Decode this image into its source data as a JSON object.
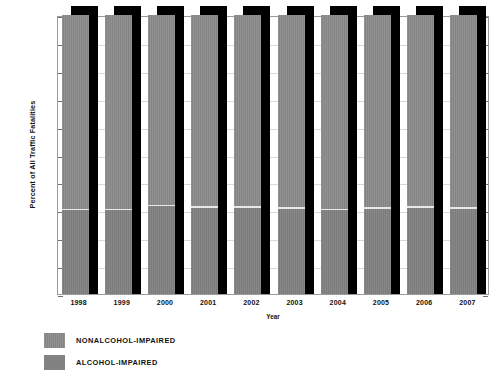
{
  "chart_data": {
    "type": "bar",
    "stacked": true,
    "title": "",
    "xlabel": "Year",
    "ylabel": "Percent of All Traffic Fatalities",
    "categories": [
      "1998",
      "1999",
      "2000",
      "2001",
      "2002",
      "2003",
      "2004",
      "2005",
      "2006",
      "2007"
    ],
    "ylim": [
      0,
      100
    ],
    "ytick_labels": [
      "0%",
      "10%",
      "20%",
      "30%",
      "40%",
      "50%",
      "60%",
      "70%",
      "80%",
      "90%",
      "100%"
    ],
    "ytick_values": [
      0,
      10,
      20,
      30,
      40,
      50,
      60,
      70,
      80,
      90,
      100
    ],
    "grid": true,
    "legend_position": "bottom-left",
    "series": [
      {
        "name": "NONALCOHOL-IMPAIRED",
        "color": "#8a8a8a",
        "values": [
          70.0,
          70.0,
          68.5,
          69.0,
          69.0,
          69.5,
          70.0,
          69.5,
          69.0,
          69.5
        ]
      },
      {
        "name": "ALCOHOL-IMPAIRED",
        "color": "#828282",
        "values": [
          30.0,
          30.0,
          31.5,
          31.0,
          31.0,
          30.5,
          30.0,
          30.5,
          31.0,
          30.5
        ]
      }
    ]
  },
  "legend": {
    "items": [
      {
        "label": "NONALCOHOL-IMPAIRED",
        "swatch": "nonalcohol"
      },
      {
        "label": "ALCOHOL-IMPAIRED",
        "swatch": "alcohol"
      }
    ]
  },
  "colors": {
    "nonalcohol": "#8a8a8a",
    "alcohol": "#828282",
    "shadow": "#000000",
    "gridline": "#d8d8d8",
    "axis": "#9a9a9a",
    "background": "#ffffff"
  }
}
